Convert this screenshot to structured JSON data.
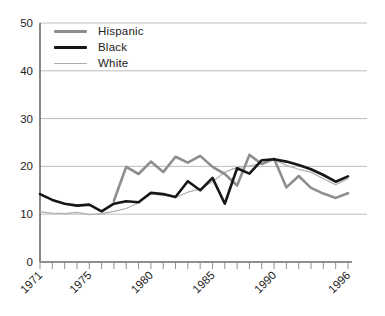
{
  "chart_data": {
    "type": "line",
    "title": "",
    "xlabel": "",
    "ylabel": "",
    "ylim": [
      0,
      50
    ],
    "yticks": [
      0,
      10,
      20,
      30,
      40,
      50
    ],
    "xtick_labels": [
      "1971",
      "1975",
      "1980",
      "1985",
      "1990",
      "1996"
    ],
    "xtick_years": [
      1971,
      1975,
      1980,
      1985,
      1990,
      1996
    ],
    "grid": true,
    "legend_position": "top-left",
    "x": [
      1971,
      1972,
      1973,
      1974,
      1975,
      1976,
      1977,
      1978,
      1979,
      1980,
      1981,
      1982,
      1983,
      1984,
      1985,
      1986,
      1987,
      1988,
      1989,
      1990,
      1991,
      1992,
      1993,
      1994,
      1995,
      1996
    ],
    "series": [
      {
        "name": "Hispanic",
        "color": "#8e8e8e",
        "stroke_width": 2.6,
        "values": [
          null,
          null,
          null,
          null,
          null,
          null,
          12.8,
          19.9,
          18.4,
          21.0,
          18.8,
          22.0,
          20.8,
          22.2,
          19.9,
          18.4,
          16.0,
          22.4,
          20.5,
          21.6,
          15.6,
          18.0,
          15.5,
          14.3,
          13.4,
          14.4
        ]
      },
      {
        "name": "Black",
        "color": "#161616",
        "stroke_width": 2.6,
        "values": [
          14.2,
          13.0,
          12.2,
          11.8,
          12.0,
          10.6,
          12.2,
          12.7,
          12.5,
          14.5,
          14.2,
          13.6,
          16.9,
          15.0,
          17.6,
          12.2,
          19.6,
          18.5,
          21.3,
          21.5,
          21.0,
          20.3,
          19.4,
          18.2,
          16.8,
          17.9
        ]
      },
      {
        "name": "White",
        "color": "#aeaeae",
        "stroke_width": 1.2,
        "values": [
          10.5,
          10.2,
          10.1,
          10.4,
          9.9,
          10.1,
          10.6,
          11.2,
          12.4,
          14.2,
          14.0,
          13.5,
          14.6,
          15.3,
          16.8,
          18.8,
          19.8,
          20.1,
          20.6,
          21.4,
          20.2,
          19.4,
          18.8,
          17.4,
          16.2,
          17.4
        ]
      }
    ]
  },
  "style": {
    "gridline_color": "#bdbdbd",
    "y_axis_color": "#3a3a3a",
    "x_axis_color": "#8f8f8f",
    "tick_color": "#8f8f8f",
    "label_color": "#222222",
    "background": "#ffffff"
  }
}
